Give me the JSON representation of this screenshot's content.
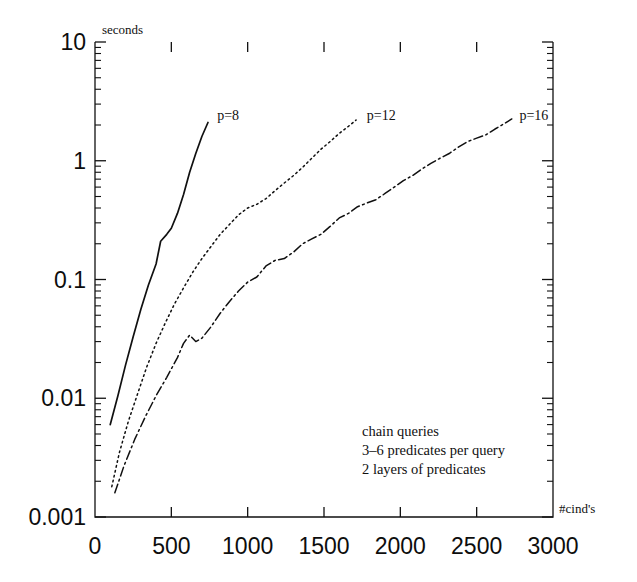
{
  "chart_data": {
    "type": "line",
    "title": "",
    "xlabel": "#cind's",
    "ylabel": "seconds",
    "yscale": "log",
    "xscale": "linear",
    "xlim": [
      0,
      3000
    ],
    "ylim": [
      0.001,
      10
    ],
    "grid": false,
    "legend_position": "inline-at-curve-end",
    "xticks": [
      0,
      500,
      1000,
      1500,
      2000,
      2500,
      3000
    ],
    "xtick_labels": [
      "0",
      "500",
      "1000",
      "1500",
      "2000",
      "2500",
      "3000"
    ],
    "yticks": [
      0.001,
      0.01,
      0.1,
      1,
      10
    ],
    "ytick_labels": [
      "0.001",
      "0.01",
      "0.1",
      "1",
      "10"
    ],
    "annotations": [
      "chain queries",
      "3–6 predicates per query",
      "2 layers of predicates"
    ],
    "series": [
      {
        "name": "p=8",
        "label": "p=8",
        "style": "solid",
        "color": "#101010",
        "label_x": 800,
        "label_y": 2.4,
        "points": [
          [
            100,
            0.006
          ],
          [
            150,
            0.0105
          ],
          [
            200,
            0.019
          ],
          [
            250,
            0.033
          ],
          [
            300,
            0.056
          ],
          [
            350,
            0.09
          ],
          [
            400,
            0.135
          ],
          [
            430,
            0.21
          ],
          [
            470,
            0.24
          ],
          [
            500,
            0.27
          ],
          [
            540,
            0.36
          ],
          [
            580,
            0.52
          ],
          [
            620,
            0.8
          ],
          [
            660,
            1.15
          ],
          [
            700,
            1.6
          ],
          [
            740,
            2.1
          ]
        ]
      },
      {
        "name": "p=12",
        "label": "p=12",
        "style": "dotted",
        "color": "#101010",
        "label_x": 1780,
        "label_y": 2.4,
        "points": [
          [
            110,
            0.0018
          ],
          [
            160,
            0.0035
          ],
          [
            220,
            0.0065
          ],
          [
            280,
            0.011
          ],
          [
            340,
            0.0185
          ],
          [
            400,
            0.029
          ],
          [
            460,
            0.043
          ],
          [
            520,
            0.062
          ],
          [
            580,
            0.085
          ],
          [
            640,
            0.115
          ],
          [
            700,
            0.15
          ],
          [
            760,
            0.19
          ],
          [
            820,
            0.24
          ],
          [
            880,
            0.29
          ],
          [
            940,
            0.35
          ],
          [
            1000,
            0.4
          ],
          [
            1060,
            0.43
          ],
          [
            1120,
            0.48
          ],
          [
            1180,
            0.56
          ],
          [
            1240,
            0.65
          ],
          [
            1300,
            0.75
          ],
          [
            1360,
            0.88
          ],
          [
            1420,
            1.05
          ],
          [
            1480,
            1.25
          ],
          [
            1540,
            1.45
          ],
          [
            1600,
            1.7
          ],
          [
            1660,
            1.95
          ],
          [
            1710,
            2.2
          ]
        ]
      },
      {
        "name": "p=16",
        "label": "p=16",
        "style": "dashdot",
        "color": "#101010",
        "label_x": 2780,
        "label_y": 2.4,
        "points": [
          [
            130,
            0.0016
          ],
          [
            190,
            0.0027
          ],
          [
            260,
            0.0045
          ],
          [
            330,
            0.007
          ],
          [
            400,
            0.0105
          ],
          [
            470,
            0.015
          ],
          [
            540,
            0.022
          ],
          [
            580,
            0.029
          ],
          [
            620,
            0.034
          ],
          [
            660,
            0.03
          ],
          [
            700,
            0.032
          ],
          [
            760,
            0.04
          ],
          [
            820,
            0.052
          ],
          [
            880,
            0.065
          ],
          [
            940,
            0.08
          ],
          [
            1000,
            0.095
          ],
          [
            1060,
            0.105
          ],
          [
            1120,
            0.13
          ],
          [
            1180,
            0.145
          ],
          [
            1240,
            0.15
          ],
          [
            1300,
            0.17
          ],
          [
            1360,
            0.2
          ],
          [
            1420,
            0.22
          ],
          [
            1480,
            0.24
          ],
          [
            1540,
            0.28
          ],
          [
            1600,
            0.33
          ],
          [
            1660,
            0.36
          ],
          [
            1720,
            0.41
          ],
          [
            1780,
            0.44
          ],
          [
            1840,
            0.47
          ],
          [
            1900,
            0.53
          ],
          [
            1960,
            0.6
          ],
          [
            2020,
            0.68
          ],
          [
            2080,
            0.75
          ],
          [
            2140,
            0.85
          ],
          [
            2200,
            0.95
          ],
          [
            2260,
            1.05
          ],
          [
            2320,
            1.15
          ],
          [
            2380,
            1.3
          ],
          [
            2440,
            1.45
          ],
          [
            2500,
            1.55
          ],
          [
            2560,
            1.65
          ],
          [
            2620,
            1.85
          ],
          [
            2680,
            2.05
          ],
          [
            2730,
            2.25
          ]
        ]
      }
    ]
  },
  "axes": {
    "seconds_label": "seconds",
    "xaxis_label": "#cind's"
  }
}
